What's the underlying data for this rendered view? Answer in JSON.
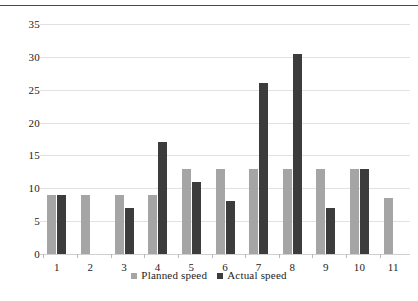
{
  "page": {
    "top_rule": "horizontal-rule"
  },
  "chart_data": {
    "type": "bar",
    "title": "",
    "subtitle": "",
    "xlabel": "",
    "ylabel": "",
    "categories": [
      "1",
      "2",
      "3",
      "4",
      "5",
      "6",
      "7",
      "8",
      "9",
      "10",
      "11"
    ],
    "series": [
      {
        "name": "Planned speed",
        "color": "#a5a5a5",
        "values": [
          9,
          9,
          9,
          9,
          13,
          13,
          13,
          13,
          13,
          13,
          8.5
        ]
      },
      {
        "name": "Actual speed",
        "color": "#3c3c3c",
        "values": [
          9,
          null,
          7,
          17,
          11,
          8,
          26,
          30.5,
          7,
          13,
          null
        ]
      }
    ],
    "ylim": [
      0,
      35
    ],
    "yticks": [
      0,
      5,
      10,
      15,
      20,
      25,
      30,
      35
    ],
    "ytick_labels": [
      "0",
      "5",
      "10",
      "15",
      "20",
      "25",
      "30",
      "35"
    ],
    "grid": true,
    "grid_axis": "y",
    "legend_position": "bottom",
    "legend_entries": [
      "Planned speed",
      "Actual speed"
    ]
  }
}
